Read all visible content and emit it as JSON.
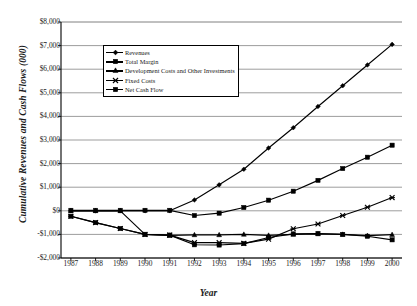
{
  "axes": {
    "ylabel": "Cumulative Revenues and Cash Flows (000)",
    "xlabel": "Year",
    "yticks": [
      "$8,000",
      "$7,000",
      "$6,000",
      "$5,000",
      "$4,000",
      "$3,000",
      "$2,000",
      "$1,000",
      "$0",
      "-$1,000",
      "-$2,000"
    ],
    "xticks": [
      "1987",
      "1988",
      "1989",
      "1990",
      "1991",
      "1992",
      "1993",
      "1994",
      "1995",
      "1996",
      "1997",
      "1998",
      "1999",
      "2000"
    ]
  },
  "legend": {
    "items": [
      {
        "label": "Revenues",
        "marker": "diamond"
      },
      {
        "label": "Total Margin",
        "marker": "square"
      },
      {
        "label": "Development Costs and Other Investments",
        "marker": "triangle"
      },
      {
        "label": "Fixed Costs",
        "marker": "x"
      },
      {
        "label": "Net Cash Flow",
        "marker": "filled-square"
      }
    ]
  },
  "chart_data": {
    "type": "line",
    "title": "",
    "xlabel": "Year",
    "ylabel": "Cumulative Revenues and Cash Flows (000)",
    "x": [
      1987,
      1988,
      1989,
      1990,
      1991,
      1992,
      1993,
      1994,
      1995,
      1996,
      1997,
      1998,
      1999,
      2000
    ],
    "categories": [
      "1987",
      "1988",
      "1989",
      "1990",
      "1991",
      "1992",
      "1993",
      "1994",
      "1995",
      "1996",
      "1997",
      "1998",
      "1999",
      "2000"
    ],
    "xlim": [
      1986.6,
      2000.4
    ],
    "ylim": [
      -2000,
      8000
    ],
    "ytick_values": [
      8000,
      7000,
      6000,
      5000,
      4000,
      3000,
      2000,
      1000,
      0,
      -1000,
      -2000
    ],
    "grid": "horizontal",
    "legend_position": "upper-left-inside",
    "units": "thousands of dollars",
    "series": [
      {
        "name": "Revenues",
        "marker": "diamond",
        "color": "#000000",
        "values": [
          0,
          0,
          0,
          0,
          0,
          460,
          1100,
          1760,
          2660,
          3520,
          4420,
          5300,
          6180,
          7050
        ]
      },
      {
        "name": "Total Margin",
        "marker": "square",
        "color": "#000000",
        "values": [
          20,
          20,
          20,
          20,
          20,
          -200,
          -100,
          140,
          450,
          830,
          1290,
          1790,
          2270,
          2780
        ]
      },
      {
        "name": "Development Costs and Other Investments",
        "marker": "triangle",
        "color": "#000000",
        "values": [
          0,
          0,
          0,
          -1000,
          -1040,
          -1020,
          -1020,
          -1000,
          -1040,
          -1000,
          -980,
          -1000,
          -1050,
          -1010
        ]
      },
      {
        "name": "Fixed Costs",
        "marker": "x",
        "color": "#000000",
        "values": [
          -230,
          -500,
          -750,
          -1000,
          -1030,
          -1350,
          -1350,
          -1380,
          -1200,
          -760,
          -560,
          -200,
          150,
          560
        ]
      },
      {
        "name": "Net Cash Flow",
        "marker": "filled-square",
        "color": "#000000",
        "values": [
          -230,
          -500,
          -750,
          -1000,
          -1030,
          -1440,
          -1450,
          -1390,
          -1130,
          -980,
          -960,
          -1000,
          -1080,
          -1230
        ]
      }
    ]
  }
}
